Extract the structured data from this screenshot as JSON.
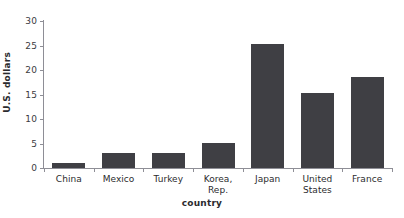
{
  "figure": {
    "caption_remnant": "·   ·  ·    ··   ·  ·     ·",
    "background_color": "#ffffff"
  },
  "chart_data": {
    "type": "bar",
    "title": "",
    "subtitle": "",
    "xlabel": "country",
    "ylabel": "U.S. dollars",
    "categories": [
      "China",
      "Mexico",
      "Turkey",
      "Korea, Rep.",
      "Japan",
      "United\nStates",
      "France"
    ],
    "values": [
      1.0,
      3.0,
      3.0,
      5.2,
      25.4,
      15.4,
      18.5
    ],
    "ylim": [
      0,
      30
    ],
    "yticks": [
      0,
      5,
      10,
      15,
      20,
      25,
      30
    ],
    "ytick_labels": [
      "0",
      "5",
      "10",
      "15",
      "20",
      "25",
      "30"
    ],
    "grid": false,
    "legend": null,
    "bar_color": "#3f3f44",
    "axis_color": "#8e8e96"
  }
}
